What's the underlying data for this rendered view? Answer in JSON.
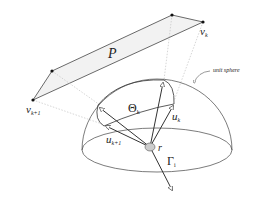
{
  "diagram": {
    "labels": {
      "polygon": "P",
      "vertex_k": "v",
      "vertex_k_sub": "k",
      "vertex_k1": "v",
      "vertex_k1_sub": "k+1",
      "unit_sphere": "unit sphere",
      "theta": "Θ",
      "theta_sub": "k",
      "u_k": "u",
      "u_k_sub": "k",
      "u_k1": "u",
      "u_k1_sub": "k+1",
      "r": "r",
      "gamma": "Γ",
      "gamma_sub": "i"
    },
    "colors": {
      "line": "#333333",
      "guide": "#bbbbbb",
      "polygon_fill": "#f2f2f2",
      "point": "#111111",
      "r_fill": "#cccccc"
    }
  }
}
